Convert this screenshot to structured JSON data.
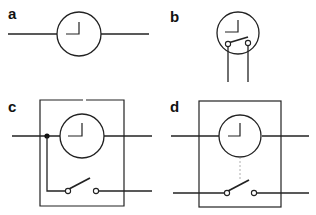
{
  "figure": {
    "type": "circuit-diagram",
    "panels": [
      {
        "label": "a",
        "description": "Clock symbol on a line"
      },
      {
        "label": "b",
        "description": "Clock with integrated switch, two leads"
      },
      {
        "label": "c",
        "description": "Time switch in enclosure; switch fed from clock supply junction"
      },
      {
        "label": "d",
        "description": "Time switch in enclosure; switch on separate circuit, mechanically linked (dashed)"
      }
    ]
  },
  "colors": {
    "stroke": "#222222",
    "background": "#ffffff",
    "linkage": "#999999"
  }
}
